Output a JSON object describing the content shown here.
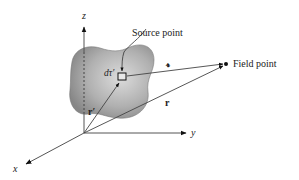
{
  "diagram": {
    "type": "vector-geometry",
    "labels": {
      "z_axis": "z",
      "y_axis": "y",
      "x_axis": "x",
      "source_point": "Source point",
      "field_point": "Field point",
      "volume_element": "dτ′",
      "separation_vector": "𝓻",
      "source_position": "r′",
      "field_position": "r"
    },
    "colors": {
      "background": "#ffffff",
      "line": "#555555",
      "arrow": "#111111",
      "blob_light": "#d8d8d8",
      "blob_dark": "#8c8c8c"
    }
  }
}
